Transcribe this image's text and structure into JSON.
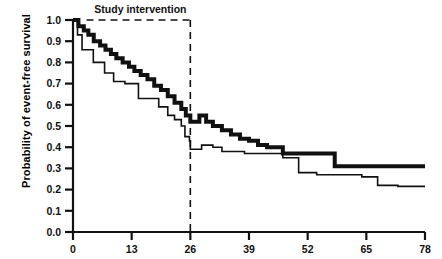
{
  "chart_data": {
    "type": "line",
    "title": "",
    "xlabel": "",
    "ylabel": "Probability of event-free survival",
    "xlim": [
      0,
      78
    ],
    "ylim": [
      0,
      1.0
    ],
    "xticks": [
      0,
      13,
      26,
      39,
      52,
      65,
      78
    ],
    "xticklabels": [
      "0",
      "13",
      "26",
      "39",
      "52",
      "65",
      "78"
    ],
    "yticks": [
      0.0,
      0.1,
      0.2,
      0.3,
      0.4,
      0.5,
      0.6,
      0.7,
      0.8,
      0.9,
      1.0
    ],
    "yticklabels": [
      "0.0",
      "0.1",
      "0.2",
      "0.3",
      "0.4",
      "0.5",
      "0.6",
      "0.7",
      "0.8",
      "0.9",
      "1.0"
    ],
    "grid": false,
    "legend": null,
    "annotations": [
      {
        "name": "study-intervention",
        "text": "Study intervention",
        "type": "dashed-bracket",
        "x_start": 3,
        "x_end": 26,
        "y": 1.0,
        "vertical_line_x": 26,
        "vertical_line_y_from": 1.0,
        "vertical_line_y_to": 0.0
      }
    ],
    "series": [
      {
        "name": "Treatment group (thick line)",
        "style": "step",
        "linewidth": 4,
        "color": "#111111",
        "points": [
          [
            0,
            1.0
          ],
          [
            1.2,
            1.0
          ],
          [
            1.2,
            0.97
          ],
          [
            2.4,
            0.97
          ],
          [
            2.4,
            0.95
          ],
          [
            3.4,
            0.95
          ],
          [
            3.4,
            0.93
          ],
          [
            4.6,
            0.93
          ],
          [
            4.6,
            0.9
          ],
          [
            6.0,
            0.9
          ],
          [
            6.0,
            0.88
          ],
          [
            7.2,
            0.88
          ],
          [
            7.2,
            0.86
          ],
          [
            8.4,
            0.86
          ],
          [
            8.4,
            0.84
          ],
          [
            9.6,
            0.84
          ],
          [
            9.6,
            0.82
          ],
          [
            11.0,
            0.82
          ],
          [
            11.0,
            0.8
          ],
          [
            12.4,
            0.8
          ],
          [
            12.4,
            0.78
          ],
          [
            13.6,
            0.78
          ],
          [
            13.6,
            0.76
          ],
          [
            15.0,
            0.76
          ],
          [
            15.0,
            0.74
          ],
          [
            16.5,
            0.74
          ],
          [
            16.5,
            0.72
          ],
          [
            18.0,
            0.72
          ],
          [
            18.0,
            0.69
          ],
          [
            19.5,
            0.69
          ],
          [
            19.5,
            0.67
          ],
          [
            21.0,
            0.67
          ],
          [
            21.0,
            0.64
          ],
          [
            22.5,
            0.64
          ],
          [
            22.5,
            0.61
          ],
          [
            24.0,
            0.61
          ],
          [
            24.0,
            0.58
          ],
          [
            25.0,
            0.58
          ],
          [
            25.0,
            0.55
          ],
          [
            26.0,
            0.55
          ],
          [
            26.0,
            0.52
          ],
          [
            28.0,
            0.52
          ],
          [
            28.0,
            0.55
          ],
          [
            29.5,
            0.55
          ],
          [
            29.5,
            0.52
          ],
          [
            31.0,
            0.52
          ],
          [
            31.0,
            0.5
          ],
          [
            33.0,
            0.5
          ],
          [
            33.0,
            0.48
          ],
          [
            35.0,
            0.48
          ],
          [
            35.0,
            0.46
          ],
          [
            37.0,
            0.46
          ],
          [
            37.0,
            0.44
          ],
          [
            39.0,
            0.44
          ],
          [
            39.0,
            0.43
          ],
          [
            41.0,
            0.43
          ],
          [
            41.0,
            0.41
          ],
          [
            43.0,
            0.41
          ],
          [
            43.0,
            0.4
          ],
          [
            46.5,
            0.4
          ],
          [
            46.5,
            0.37
          ],
          [
            58.0,
            0.37
          ],
          [
            58.0,
            0.31
          ],
          [
            78.0,
            0.31
          ]
        ]
      },
      {
        "name": "Control group (thin line)",
        "style": "step",
        "linewidth": 1.6,
        "color": "#111111",
        "points": [
          [
            0,
            1.0
          ],
          [
            1.0,
            1.0
          ],
          [
            1.0,
            0.93
          ],
          [
            2.0,
            0.93
          ],
          [
            2.0,
            0.86
          ],
          [
            4.5,
            0.86
          ],
          [
            4.5,
            0.8
          ],
          [
            7.0,
            0.8
          ],
          [
            7.0,
            0.75
          ],
          [
            9.0,
            0.75
          ],
          [
            9.0,
            0.71
          ],
          [
            11.5,
            0.71
          ],
          [
            11.5,
            0.7
          ],
          [
            14.5,
            0.7
          ],
          [
            14.5,
            0.63
          ],
          [
            19.0,
            0.63
          ],
          [
            19.0,
            0.59
          ],
          [
            21.0,
            0.59
          ],
          [
            21.0,
            0.55
          ],
          [
            22.5,
            0.55
          ],
          [
            22.5,
            0.53
          ],
          [
            24.0,
            0.53
          ],
          [
            24.0,
            0.5
          ],
          [
            24.8,
            0.5
          ],
          [
            24.8,
            0.45
          ],
          [
            25.8,
            0.45
          ],
          [
            25.8,
            0.43
          ],
          [
            26.0,
            0.43
          ],
          [
            26.0,
            0.39
          ],
          [
            28.5,
            0.39
          ],
          [
            28.5,
            0.41
          ],
          [
            31.0,
            0.41
          ],
          [
            31.0,
            0.4
          ],
          [
            33.0,
            0.4
          ],
          [
            33.0,
            0.38
          ],
          [
            38.0,
            0.38
          ],
          [
            38.0,
            0.37
          ],
          [
            46.5,
            0.37
          ],
          [
            46.5,
            0.35
          ],
          [
            50.0,
            0.35
          ],
          [
            50.0,
            0.28
          ],
          [
            54.0,
            0.28
          ],
          [
            54.0,
            0.27
          ],
          [
            64.0,
            0.27
          ],
          [
            64.0,
            0.26
          ],
          [
            67.5,
            0.26
          ],
          [
            67.5,
            0.22
          ],
          [
            72.0,
            0.22
          ],
          [
            72.0,
            0.215
          ],
          [
            78.0,
            0.215
          ]
        ]
      }
    ]
  }
}
